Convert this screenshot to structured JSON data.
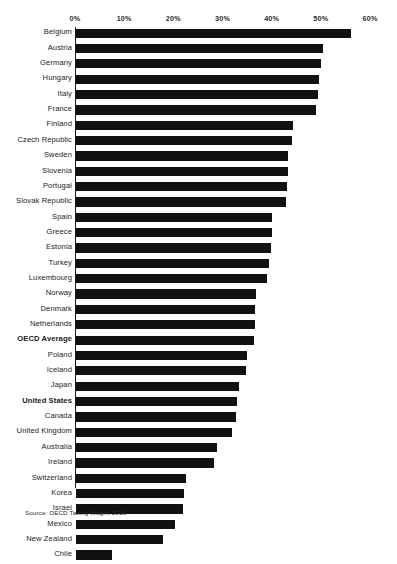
{
  "chart_data": {
    "type": "bar",
    "orientation": "horizontal",
    "title": "",
    "subtitle": "",
    "xlabel": "",
    "ylabel": "",
    "xlim": [
      0,
      60
    ],
    "xtick_labels": [
      "0%",
      "10%",
      "20%",
      "30%",
      "40%",
      "50%",
      "60%"
    ],
    "xtick_values": [
      0,
      10,
      20,
      30,
      40,
      50,
      60
    ],
    "grid": false,
    "legend": null,
    "bar_color": "#111111",
    "categories": [
      "Belgium",
      "Austria",
      "Germany",
      "Hungary",
      "Italy",
      "France",
      "Finland",
      "Czech Republic",
      "Sweden",
      "Slovenia",
      "Portugal",
      "Slovak Republic",
      "Spain",
      "Greece",
      "Estonia",
      "Turkey",
      "Luxembourg",
      "Norway",
      "Denmark",
      "Netherlands",
      "OECD Average",
      "Poland",
      "Iceland",
      "Japan",
      "United States",
      "Canada",
      "United Kingdom",
      "Australia",
      "Ireland",
      "Switzerland",
      "Korea",
      "Israel",
      "Mexico",
      "New Zealand",
      "Chile"
    ],
    "values": [
      56.0,
      50.2,
      49.8,
      49.5,
      49.2,
      48.8,
      44.1,
      44.0,
      43.2,
      43.1,
      43.0,
      42.7,
      39.9,
      39.8,
      39.6,
      39.3,
      38.8,
      36.7,
      36.5,
      36.4,
      36.2,
      34.7,
      34.5,
      33.2,
      32.7,
      32.6,
      31.8,
      28.6,
      28.0,
      22.4,
      22.0,
      21.7,
      20.1,
      17.6,
      7.3
    ],
    "highlighted_categories": [
      "OECD Average",
      "United States"
    ],
    "source_note": "Source: OECD Taxing Wages 2016"
  }
}
